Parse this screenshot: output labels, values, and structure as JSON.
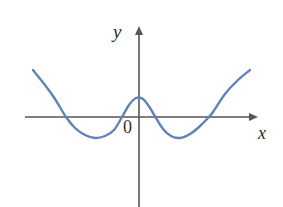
{
  "figure": {
    "background_color": "#ffffff"
  },
  "labels": {
    "y_axis": "y",
    "x_axis": "x",
    "origin": "0"
  },
  "colors": {
    "curve": "#5f82b8",
    "axis": "#555555",
    "text": "#2b2b2b",
    "background": "#ffffff"
  },
  "chart_data": {
    "type": "line",
    "title": "",
    "subtitle": "",
    "xlabel": "x",
    "ylabel": "y",
    "grid": false,
    "legend": null,
    "axis_style": {
      "x_axis_pixel_y": 117,
      "y_axis_pixel_x": 139,
      "x_axis_from_pixel_x": 25,
      "x_axis_to_pixel_x": 258,
      "y_axis_from_pixel_y": 27,
      "y_axis_to_pixel_y": 207,
      "arrowheads": [
        "x-positive",
        "y-positive"
      ],
      "tick_labels": [
        "0"
      ]
    },
    "series": [
      {
        "name": "quartic curve",
        "color": "#5f82b8",
        "points_pixel": [
          [
            33,
            70
          ],
          [
            45,
            85
          ],
          [
            55,
            99
          ],
          [
            66,
            117
          ],
          [
            75,
            128
          ],
          [
            85,
            135
          ],
          [
            95,
            138
          ],
          [
            105,
            136
          ],
          [
            114,
            130
          ],
          [
            122,
            117
          ],
          [
            129,
            105
          ],
          [
            136,
            98
          ],
          [
            143,
            99
          ],
          [
            150,
            108
          ],
          [
            156,
            118
          ],
          [
            163,
            129
          ],
          [
            171,
            136
          ],
          [
            180,
            138
          ],
          [
            190,
            134
          ],
          [
            199,
            127
          ],
          [
            208,
            118
          ],
          [
            213,
            112
          ],
          [
            225,
            94
          ],
          [
            238,
            80
          ],
          [
            250,
            70
          ]
        ]
      }
    ],
    "features": {
      "x_intercepts_pixel_x": [
        66,
        122,
        155,
        213
      ],
      "local_minima_pixel": [
        [
          95,
          138
        ],
        [
          180,
          138
        ]
      ],
      "local_maxima_pixel": [
        [
          136,
          98
        ]
      ],
      "x_intercept_count": 4,
      "degree": 4,
      "leading_coefficient_sign": "positive"
    }
  }
}
